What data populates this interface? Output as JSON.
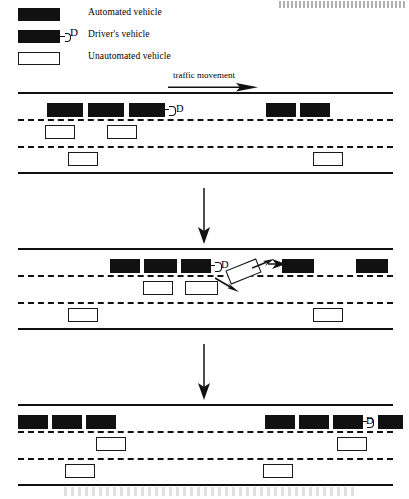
{
  "figure": {
    "type": "traffic-scenario-diagram",
    "title_visible": false,
    "header_artifact": "cut-off running head (illegible)",
    "caption_artifact": "cut-off figure caption (illegible)"
  },
  "legend": {
    "items": [
      {
        "id": "automated",
        "label": "Automated vehicle",
        "style": "filled",
        "color": "#111111"
      },
      {
        "id": "drivers",
        "label": "Driver's vehicle",
        "style": "filled-with-marker",
        "color": "#111111",
        "marker": "D"
      },
      {
        "id": "unautomated",
        "label": "Unautomated vehicle",
        "style": "hollow",
        "color": "#ffffff"
      }
    ]
  },
  "traffic_direction": {
    "label": "traffic movement",
    "arrow": "right-arrow-icon"
  },
  "flow": {
    "step_arrow_1": "down-arrow-icon",
    "step_arrow_2": "down-arrow-icon"
  },
  "panels": [
    {
      "id": "panel-1",
      "name": "initial-state",
      "lanes": 3,
      "vehicles": [
        {
          "type": "automated",
          "lane": 1,
          "x": 47,
          "y": 11,
          "w": 36,
          "h": 14
        },
        {
          "type": "automated",
          "lane": 1,
          "x": 88,
          "y": 11,
          "w": 36,
          "h": 14
        },
        {
          "type": "drivers",
          "lane": 1,
          "x": 129,
          "y": 11,
          "w": 36,
          "h": 14,
          "marker": "D"
        },
        {
          "type": "automated",
          "lane": 1,
          "x": 266,
          "y": 11,
          "w": 30,
          "h": 14
        },
        {
          "type": "automated",
          "lane": 1,
          "x": 300,
          "y": 11,
          "w": 30,
          "h": 14
        },
        {
          "type": "unautomated",
          "lane": 2,
          "x": 45,
          "y": 33,
          "w": 30,
          "h": 14
        },
        {
          "type": "unautomated",
          "lane": 2,
          "x": 107,
          "y": 33,
          "w": 30,
          "h": 14
        },
        {
          "type": "unautomated",
          "lane": 3,
          "x": 68,
          "y": 60,
          "w": 30,
          "h": 14
        },
        {
          "type": "unautomated",
          "lane": 3,
          "x": 313,
          "y": 60,
          "w": 30,
          "h": 14
        }
      ]
    },
    {
      "id": "panel-2",
      "name": "merging-state",
      "lanes": 3,
      "vehicles": [
        {
          "type": "automated",
          "lane": 1,
          "x": 110,
          "y": 11,
          "w": 30,
          "h": 14
        },
        {
          "type": "automated",
          "lane": 1,
          "x": 144,
          "y": 11,
          "w": 33,
          "h": 14
        },
        {
          "type": "drivers",
          "lane": 1,
          "x": 175,
          "y": 11,
          "w": 30,
          "h": 14,
          "marker": "D"
        },
        {
          "type": "automated",
          "lane": 1,
          "x": 282,
          "y": 11,
          "w": 32,
          "h": 14
        },
        {
          "type": "automated",
          "lane": 1,
          "x": 356,
          "y": 11,
          "w": 32,
          "h": 14
        },
        {
          "type": "unautomated",
          "lane": 2,
          "x": 143,
          "y": 33,
          "w": 30,
          "h": 14
        },
        {
          "type": "unautomated",
          "lane": 2,
          "x": 185,
          "y": 33,
          "w": 33,
          "h": 14
        },
        {
          "type": "merging",
          "lane": "1-2",
          "x": 227,
          "y": 18,
          "w": 33,
          "h": 15,
          "rotation": -22
        },
        {
          "type": "unautomated",
          "lane": 3,
          "x": 68,
          "y": 60,
          "w": 30,
          "h": 14
        },
        {
          "type": "unautomated",
          "lane": 3,
          "x": 313,
          "y": 60,
          "w": 30,
          "h": 14
        }
      ],
      "motion_arrows": [
        {
          "id": "merge-arrow-entry",
          "from_lane": 2,
          "to_lane": 1
        },
        {
          "id": "merge-arrow-exit",
          "from_lane": 2,
          "to_lane": 1
        },
        {
          "id": "gap-arrow",
          "from_lane": 1,
          "to_lane": 1
        }
      ]
    },
    {
      "id": "panel-3",
      "name": "resulting-state",
      "lanes": 3,
      "vehicles": [
        {
          "type": "automated",
          "lane": 1,
          "x": 18,
          "y": 11,
          "w": 30,
          "h": 14
        },
        {
          "type": "automated",
          "lane": 1,
          "x": 52,
          "y": 11,
          "w": 30,
          "h": 14
        },
        {
          "type": "automated",
          "lane": 1,
          "x": 86,
          "y": 11,
          "w": 30,
          "h": 14
        },
        {
          "type": "automated",
          "lane": 1,
          "x": 265,
          "y": 11,
          "w": 30,
          "h": 14
        },
        {
          "type": "automated",
          "lane": 1,
          "x": 299,
          "y": 11,
          "w": 30,
          "h": 14
        },
        {
          "type": "drivers",
          "lane": 1,
          "x": 333,
          "y": 11,
          "w": 30,
          "h": 14,
          "marker": "D"
        },
        {
          "type": "automated",
          "lane": 1,
          "x": 378,
          "y": 11,
          "w": 25,
          "h": 14
        },
        {
          "type": "unautomated",
          "lane": 2,
          "x": 96,
          "y": 33,
          "w": 30,
          "h": 14
        },
        {
          "type": "unautomated",
          "lane": 2,
          "x": 337,
          "y": 33,
          "w": 30,
          "h": 14
        },
        {
          "type": "unautomated",
          "lane": 3,
          "x": 65,
          "y": 60,
          "w": 30,
          "h": 14
        },
        {
          "type": "unautomated",
          "lane": 3,
          "x": 263,
          "y": 60,
          "w": 30,
          "h": 14
        }
      ]
    }
  ]
}
